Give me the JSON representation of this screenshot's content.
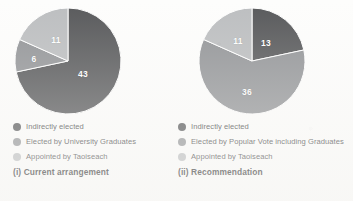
{
  "figure": {
    "background_color": "#fdfdfc",
    "palette": {
      "indirectly_elected": "#58595b",
      "elected_by_vote": "#939598",
      "appointed_by_taoiseach": "#bcbec0",
      "label_text": "#ffffff",
      "legend_text": "#4b4b4d",
      "caption_text": "#2f2f30"
    }
  },
  "chart_data": [
    {
      "type": "pie",
      "id": "current-arrangement",
      "title": "(i) Current arrangement",
      "caption": "(i) Current arrangement",
      "total": 60,
      "legend_position": "below",
      "categories": [
        "Indirectly elected",
        "Elected by University Graduates",
        "Appointed by Taoiseach"
      ],
      "values": [
        43,
        6,
        11
      ],
      "slices": [
        {
          "label": "Indirectly elected",
          "value": 43,
          "display_value": "43",
          "color": "#58595b",
          "start_angle_deg": 0,
          "end_angle_deg": 258,
          "label_x": 69,
          "label_y": 67
        },
        {
          "label": "Elected by University Graduates",
          "value": 6,
          "display_value": "6",
          "color": "#939598",
          "start_angle_deg": 258,
          "end_angle_deg": 294,
          "label_x": 20,
          "label_y": 52
        },
        {
          "label": "Appointed by Taoiseach",
          "value": 11,
          "display_value": "11",
          "color": "#bcbec0",
          "start_angle_deg": 294,
          "end_angle_deg": 360,
          "label_x": 42,
          "label_y": 33
        }
      ],
      "legend": [
        {
          "label": "Indirectly elected",
          "color": "#58595b"
        },
        {
          "label": "Elected by University Graduates",
          "color": "#939598"
        },
        {
          "label": "Appointed by Taoiseach",
          "color": "#bcbec0"
        }
      ]
    },
    {
      "type": "pie",
      "id": "recommendation",
      "title": "(ii) Recommendation",
      "caption": "(ii) Recommendation",
      "total": 60,
      "legend_position": "below",
      "categories": [
        "Indirectly elected",
        "Elected by Popular Vote including Graduates",
        "Appointed by Taoiseach"
      ],
      "values": [
        13,
        36,
        11
      ],
      "slices": [
        {
          "label": "Indirectly elected",
          "value": 13,
          "display_value": "13",
          "color": "#58595b",
          "start_angle_deg": 0,
          "end_angle_deg": 78,
          "label_x": 68,
          "label_y": 36
        },
        {
          "label": "Elected by Popular Vote including Graduates",
          "value": 36,
          "display_value": "36",
          "color": "#939598",
          "start_angle_deg": 78,
          "end_angle_deg": 294,
          "label_x": 49,
          "label_y": 85
        },
        {
          "label": "Appointed by Taoiseach",
          "value": 11,
          "display_value": "11",
          "color": "#bcbec0",
          "start_angle_deg": 294,
          "end_angle_deg": 360,
          "label_x": 40,
          "label_y": 34
        }
      ],
      "legend": [
        {
          "label": "Indirectly elected",
          "color": "#58595b"
        },
        {
          "label": "Elected by Popular Vote including Graduates",
          "color": "#939598"
        },
        {
          "label": "Appointed by Taoiseach",
          "color": "#bcbec0"
        }
      ]
    }
  ]
}
